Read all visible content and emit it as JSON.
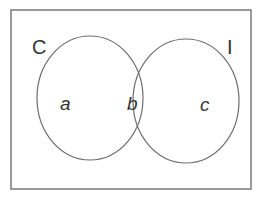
{
  "diagram": {
    "type": "venn",
    "colors": {
      "background": "#ffffff",
      "border": "#7a7a7a",
      "circle_stroke": "#6e6e6e",
      "text": "#333333"
    },
    "universe": {
      "x": 11,
      "y": 10,
      "width": 240,
      "height": 179
    },
    "sets": [
      {
        "id": "C",
        "label": "C",
        "cx": 90,
        "cy": 98,
        "rx": 53,
        "ry": 62,
        "label_x": 32,
        "label_y": 54
      },
      {
        "id": "I",
        "label": "I",
        "cx": 186,
        "cy": 101,
        "rx": 53,
        "ry": 62,
        "label_x": 227,
        "label_y": 54
      }
    ],
    "regions": [
      {
        "id": "a",
        "label": "a",
        "description": "C only",
        "x": 60,
        "y": 110
      },
      {
        "id": "b",
        "label": "b",
        "description": "C and I",
        "x": 127,
        "y": 110
      },
      {
        "id": "c",
        "label": "c",
        "description": "I only",
        "x": 200,
        "y": 111
      }
    ]
  }
}
